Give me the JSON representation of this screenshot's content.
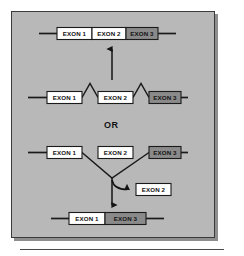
{
  "figure": {
    "alternative_label": "OR",
    "background_color": "#b8b8b8",
    "panel_border_color": "#3a3a3a",
    "exon_white_fill": "#ffffff",
    "exon_gray_fill": "#8a8a8a",
    "line_color": "#1a1a1a"
  },
  "rows": {
    "spliced_product_top": {
      "role": "mature-mrna-all-exons",
      "exons": [
        {
          "label": "EXON 1",
          "fill": "white"
        },
        {
          "label": "EXON 2",
          "fill": "white"
        },
        {
          "label": "EXON 3",
          "fill": "gray"
        }
      ]
    },
    "pre_mrna_upper": {
      "role": "pre-mrna-with-two-introns-spliced",
      "exons": [
        {
          "label": "EXON 1",
          "fill": "white"
        },
        {
          "label": "EXON 2",
          "fill": "white"
        },
        {
          "label": "EXON 3",
          "fill": "gray"
        }
      ],
      "intron_loops": 2
    },
    "pre_mrna_lower": {
      "role": "pre-mrna-with-exon-2-skipped",
      "exons": [
        {
          "label": "EXON 1",
          "fill": "white"
        },
        {
          "label": "EXON 2",
          "fill": "white"
        },
        {
          "label": "EXON 3",
          "fill": "gray"
        }
      ],
      "skip_loops": 1
    },
    "excised": {
      "role": "excised-exon",
      "label": "EXON 2",
      "fill": "white"
    },
    "spliced_product_bottom": {
      "role": "mature-mrna-exon-2-skipped",
      "exons": [
        {
          "label": "EXON 1",
          "fill": "white"
        },
        {
          "label": "EXON 3",
          "fill": "gray"
        }
      ]
    }
  }
}
